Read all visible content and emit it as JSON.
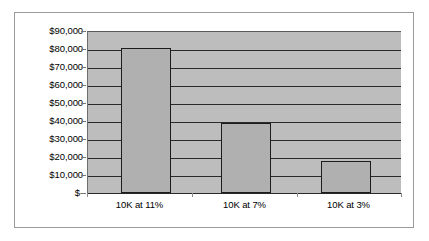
{
  "chart_data": {
    "type": "bar",
    "title": "",
    "subtitle": "",
    "xlabel": "",
    "ylabel": "",
    "categories": [
      "10K at 11%",
      "10K at 7%",
      "10K at 3%"
    ],
    "values": [
      81000,
      39000,
      18000
    ],
    "ylim": [
      0,
      90000
    ],
    "ytick_values": [
      0,
      10000,
      20000,
      30000,
      40000,
      50000,
      60000,
      70000,
      80000,
      90000
    ],
    "ytick_labels": [
      "$-",
      "$10,000",
      "$20,000",
      "$30,000",
      "$40,000",
      "$50,000",
      "$60,000",
      "$70,000",
      "$80,000",
      "$90,000"
    ],
    "grid": true,
    "legend": false,
    "legend_position": "none",
    "colors": {
      "bar_fill": "#b0b0b0",
      "bar_border": "#1c1c1c",
      "plot_background": "#bdbdbd",
      "gridline": "#2a2a2a",
      "frame_border": "#9a9a9a",
      "page_background": "#ffffff",
      "text": "#000000"
    }
  }
}
